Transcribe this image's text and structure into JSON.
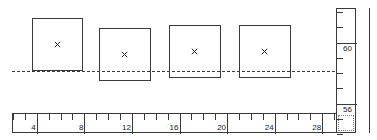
{
  "chart_data": {
    "type": "scatter",
    "title": "",
    "xlabel": "",
    "ylabel": "",
    "xlim": [
      2.0,
      30.0
    ],
    "ylim": [
      54.0,
      62.2
    ],
    "grid": false,
    "legend": null,
    "reference_lines": [
      {
        "orientation": "horizontal",
        "value": 57.0,
        "style": "dashed"
      }
    ],
    "x_ticks_major": [
      4,
      8,
      12,
      16,
      20,
      24,
      28
    ],
    "x_tick_labels": [
      "4",
      "8",
      "12",
      "16",
      "20",
      "24",
      "28"
    ],
    "x_minor_per_major": 4,
    "y_ticks_major": [
      56,
      60
    ],
    "y_tick_labels": [
      "56",
      "60"
    ],
    "y_minor_per_major": 4,
    "marker": "x",
    "boxes": [
      {
        "id": "box-1",
        "x_min": 4.0,
        "x_max": 8.0,
        "y_min": 57.0,
        "y_max": 61.2,
        "center_x": 6.0,
        "center_y": 59.1
      },
      {
        "id": "box-2",
        "x_min": 10.0,
        "x_max": 14.0,
        "y_min": 56.3,
        "y_max": 60.4,
        "center_x": 12.0,
        "center_y": 58.3
      },
      {
        "id": "box-3",
        "x_min": 16.0,
        "x_max": 20.0,
        "y_min": 56.6,
        "y_max": 60.8,
        "center_x": 18.0,
        "center_y": 58.7
      },
      {
        "id": "box-4",
        "x_min": 22.0,
        "x_max": 26.0,
        "y_min": 56.6,
        "y_max": 60.8,
        "center_x": 24.0,
        "center_y": 58.7
      }
    ]
  },
  "plot": {
    "name": "measurement-plot",
    "background": "#ffffff",
    "line_color": "#3a3a3a",
    "marker_color": "#222222"
  },
  "h_ruler": {
    "name": "horizontal-ruler",
    "labels": [
      "4",
      "8",
      "12",
      "16",
      "20",
      "24",
      "28"
    ]
  },
  "v_ruler": {
    "name": "vertical-ruler",
    "labels": [
      "60",
      "56"
    ]
  },
  "markers": {
    "glyph": "×",
    "label_1": "×",
    "label_2": "×",
    "label_3": "×",
    "label_4": "×"
  }
}
